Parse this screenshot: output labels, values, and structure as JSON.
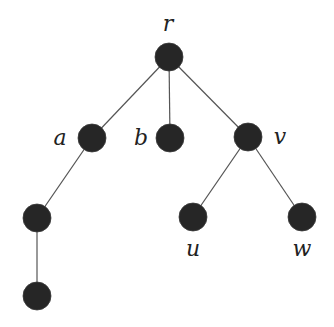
{
  "diagram": {
    "type": "rooted-tree",
    "nodes": [
      {
        "id": "r",
        "label": "r",
        "x": 169,
        "y": 57,
        "label_x": 168,
        "label_y": 31
      },
      {
        "id": "a",
        "label": "a",
        "x": 92,
        "y": 138,
        "label_x": 60,
        "label_y": 145
      },
      {
        "id": "b",
        "label": "b",
        "x": 170,
        "y": 138,
        "label_x": 141,
        "label_y": 145
      },
      {
        "id": "v",
        "label": "v",
        "x": 248,
        "y": 137,
        "label_x": 280,
        "label_y": 144
      },
      {
        "id": "a1",
        "label": "",
        "x": 37,
        "y": 218
      },
      {
        "id": "a2",
        "label": "",
        "x": 37,
        "y": 296
      },
      {
        "id": "u",
        "label": "u",
        "x": 193,
        "y": 217,
        "label_x": 193,
        "label_y": 256
      },
      {
        "id": "w",
        "label": "w",
        "x": 302,
        "y": 217,
        "label_x": 302,
        "label_y": 256
      }
    ],
    "edges": [
      [
        "r",
        "a"
      ],
      [
        "r",
        "b"
      ],
      [
        "r",
        "v"
      ],
      [
        "a",
        "a1"
      ],
      [
        "a1",
        "a2"
      ],
      [
        "v",
        "u"
      ],
      [
        "v",
        "w"
      ]
    ],
    "node_radius": 14,
    "colors": {
      "node": "#262626",
      "edge": "#555555",
      "label": "#222222"
    }
  }
}
